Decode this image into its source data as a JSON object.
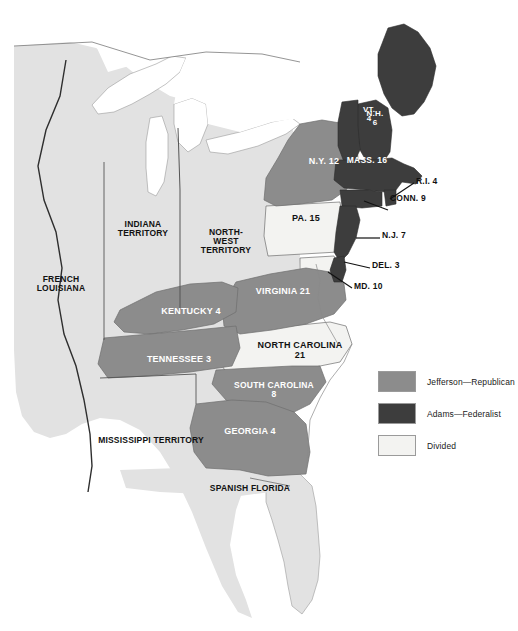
{
  "map": {
    "title": "Election of 1800 — Electoral Vote by State",
    "colors": {
      "republican": "#8c8c8c",
      "federalist": "#3d3d3d",
      "divided": "#f3f3f1",
      "territory": "#e2e2e2",
      "water": "#ffffff",
      "border": "#6e6e6e",
      "outline": "#555555"
    },
    "legend": [
      {
        "label": "Jefferson—Republican",
        "color": "#8c8c8c",
        "key": "republican"
      },
      {
        "label": "Adams—Federalist",
        "color": "#3d3d3d",
        "key": "federalist"
      },
      {
        "label": "Divided",
        "color": "#f3f3f1",
        "key": "divided"
      }
    ],
    "states": [
      {
        "name": "VT. 4",
        "abbr": "VT.",
        "votes": 4,
        "party": "federalist",
        "text": "VT.\n4"
      },
      {
        "name": "N.H. 6",
        "abbr": "N.H.",
        "votes": 6,
        "party": "federalist",
        "text": "N.H.\n6"
      },
      {
        "name": "MASS. 16",
        "abbr": "MASS.",
        "votes": 16,
        "party": "federalist",
        "text": "MASS. 16"
      },
      {
        "name": "R.I. 4",
        "abbr": "R.I.",
        "votes": 4,
        "party": "federalist",
        "text": "R.I. 4"
      },
      {
        "name": "CONN. 9",
        "abbr": "CONN.",
        "votes": 9,
        "party": "federalist",
        "text": "CONN. 9"
      },
      {
        "name": "N.Y. 12",
        "abbr": "N.Y.",
        "votes": 12,
        "party": "republican",
        "text": "N.Y. 12"
      },
      {
        "name": "N.J. 7",
        "abbr": "N.J.",
        "votes": 7,
        "party": "federalist",
        "text": "N.J. 7"
      },
      {
        "name": "PA. 15",
        "abbr": "PA.",
        "votes": 15,
        "party": "divided",
        "text": "PA. 15"
      },
      {
        "name": "DEL. 3",
        "abbr": "DEL.",
        "votes": 3,
        "party": "federalist",
        "text": "DEL. 3"
      },
      {
        "name": "MD. 10",
        "abbr": "MD.",
        "votes": 10,
        "party": "divided",
        "text": "MD. 10"
      },
      {
        "name": "VIRGINIA 21",
        "abbr": "VA.",
        "votes": 21,
        "party": "republican",
        "text": "VIRGINIA 21"
      },
      {
        "name": "KENTUCKY 4",
        "abbr": "KY.",
        "votes": 4,
        "party": "republican",
        "text": "KENTUCKY 4"
      },
      {
        "name": "TENNESSEE 3",
        "abbr": "TENN.",
        "votes": 3,
        "party": "republican",
        "text": "TENNESSEE 3"
      },
      {
        "name": "NORTH CAROLINA 21",
        "abbr": "N.C.",
        "votes": 21,
        "party": "divided",
        "text": "NORTH CAROLINA\n21"
      },
      {
        "name": "SOUTH CAROLINA 8",
        "abbr": "S.C.",
        "votes": 8,
        "party": "republican",
        "text": "SOUTH CAROLINA\n8"
      },
      {
        "name": "GEORGIA 4",
        "abbr": "GA.",
        "votes": 4,
        "party": "republican",
        "text": "GEORGIA 4"
      }
    ],
    "territories": [
      {
        "name": "FRENCH LOUISIANA",
        "text": "FRENCH\nLOUISIANA"
      },
      {
        "name": "INDIANA TERRITORY",
        "text": "INDIANA\nTERRITORY"
      },
      {
        "name": "NORTH-WEST TERRITORY",
        "text": "NORTH-\nWEST\nTERRITORY"
      },
      {
        "name": "MISSISSIPPI TERRITORY",
        "text": "MISSISSIPPI TERRITORY"
      },
      {
        "name": "SPANISH FLORIDA",
        "text": "SPANISH FLORIDA"
      }
    ]
  }
}
